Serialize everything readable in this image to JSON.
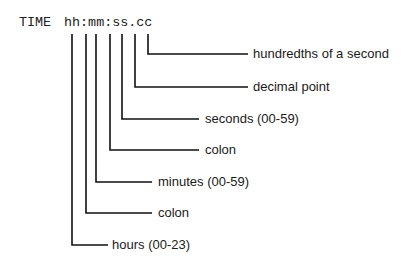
{
  "diagram": {
    "keyword": "TIME",
    "format": "hh:mm:ss.cc",
    "callouts": [
      {
        "part": "cc",
        "label": "hundredths of a second"
      },
      {
        "part": ".",
        "label": "decimal point"
      },
      {
        "part": "ss",
        "label": "seconds (00-59)"
      },
      {
        "part": ":",
        "label": "colon"
      },
      {
        "part": "mm",
        "label": "minutes (00-59)"
      },
      {
        "part": ":",
        "label": "colon"
      },
      {
        "part": "hh",
        "label": "hours (00-23)"
      }
    ]
  }
}
